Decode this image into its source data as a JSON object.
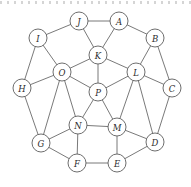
{
  "figure": {
    "kind": "graph-diagram",
    "width": 191,
    "height": 187,
    "background_color": "#ffffff",
    "node_fill_color": "#ffffff",
    "node_stroke_color": "#5d5d5d",
    "edge_color": "#6a6a6a",
    "label_color": "#2b2b2b",
    "node_radius": 9,
    "node_count": 16,
    "edge_count": 32,
    "degree": 4
  },
  "nodes": [
    {
      "id": "A",
      "label": "A",
      "x": 119,
      "y": 21
    },
    {
      "id": "B",
      "label": "B",
      "x": 155,
      "y": 38
    },
    {
      "id": "C",
      "label": "C",
      "x": 172,
      "y": 88
    },
    {
      "id": "D",
      "label": "D",
      "x": 155,
      "y": 142
    },
    {
      "id": "E",
      "label": "E",
      "x": 117,
      "y": 163
    },
    {
      "id": "F",
      "label": "F",
      "x": 77,
      "y": 163
    },
    {
      "id": "G",
      "label": "G",
      "x": 41,
      "y": 143
    },
    {
      "id": "H",
      "label": "H",
      "x": 22,
      "y": 88
    },
    {
      "id": "I",
      "label": "I",
      "x": 38,
      "y": 38
    },
    {
      "id": "J",
      "label": "J",
      "x": 79,
      "y": 21
    },
    {
      "id": "K",
      "label": "K",
      "x": 98,
      "y": 55
    },
    {
      "id": "L",
      "label": "L",
      "x": 136,
      "y": 72
    },
    {
      "id": "M",
      "label": "M",
      "x": 117,
      "y": 127
    },
    {
      "id": "N",
      "label": "N",
      "x": 78,
      "y": 125
    },
    {
      "id": "O",
      "label": "O",
      "x": 62,
      "y": 72
    },
    {
      "id": "P",
      "label": "P",
      "x": 98,
      "y": 92
    }
  ],
  "edges": [
    {
      "from": "J",
      "to": "A"
    },
    {
      "from": "J",
      "to": "I"
    },
    {
      "from": "J",
      "to": "K"
    },
    {
      "from": "A",
      "to": "B"
    },
    {
      "from": "A",
      "to": "K"
    },
    {
      "from": "B",
      "to": "C"
    },
    {
      "from": "B",
      "to": "L"
    },
    {
      "from": "C",
      "to": "D"
    },
    {
      "from": "C",
      "to": "L"
    },
    {
      "from": "D",
      "to": "E"
    },
    {
      "from": "D",
      "to": "M"
    },
    {
      "from": "E",
      "to": "F"
    },
    {
      "from": "E",
      "to": "M"
    },
    {
      "from": "F",
      "to": "G"
    },
    {
      "from": "F",
      "to": "N"
    },
    {
      "from": "G",
      "to": "H"
    },
    {
      "from": "G",
      "to": "N"
    },
    {
      "from": "H",
      "to": "I"
    },
    {
      "from": "H",
      "to": "O"
    },
    {
      "from": "I",
      "to": "O"
    },
    {
      "from": "K",
      "to": "O"
    },
    {
      "from": "K",
      "to": "L"
    },
    {
      "from": "K",
      "to": "P"
    },
    {
      "from": "L",
      "to": "M"
    },
    {
      "from": "L",
      "to": "P"
    },
    {
      "from": "M",
      "to": "N"
    },
    {
      "from": "M",
      "to": "P"
    },
    {
      "from": "N",
      "to": "O"
    },
    {
      "from": "N",
      "to": "P"
    },
    {
      "from": "O",
      "to": "P"
    },
    {
      "from": "G",
      "to": "O"
    },
    {
      "from": "D",
      "to": "L"
    }
  ]
}
